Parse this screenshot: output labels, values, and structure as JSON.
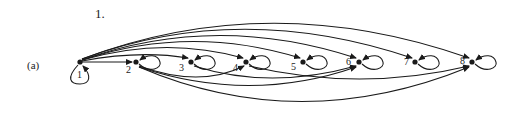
{
  "problem_number": "1.",
  "part_label": "(a)",
  "colors": {
    "ink": "#1a1a1a",
    "background": "#ffffff"
  },
  "graph": {
    "directed": true,
    "relation": "divides",
    "nodes": [
      {
        "id": 1,
        "label": "1",
        "x": 80,
        "y": 62
      },
      {
        "id": 2,
        "label": "2",
        "x": 136,
        "y": 62
      },
      {
        "id": 3,
        "label": "3",
        "x": 191,
        "y": 62
      },
      {
        "id": 4,
        "label": "4",
        "x": 246,
        "y": 62
      },
      {
        "id": 5,
        "label": "5",
        "x": 303,
        "y": 62
      },
      {
        "id": 6,
        "label": "6",
        "x": 359,
        "y": 62
      },
      {
        "id": 7,
        "label": "7",
        "x": 415,
        "y": 62
      },
      {
        "id": 8,
        "label": "8",
        "x": 472,
        "y": 62
      }
    ],
    "self_loops": [
      1,
      2,
      3,
      4,
      5,
      6,
      7,
      8
    ],
    "edges": [
      [
        1,
        2
      ],
      [
        1,
        3
      ],
      [
        1,
        4
      ],
      [
        1,
        5
      ],
      [
        1,
        6
      ],
      [
        1,
        7
      ],
      [
        1,
        8
      ],
      [
        2,
        4
      ],
      [
        2,
        6
      ],
      [
        2,
        8
      ],
      [
        3,
        6
      ],
      [
        4,
        8
      ]
    ]
  }
}
